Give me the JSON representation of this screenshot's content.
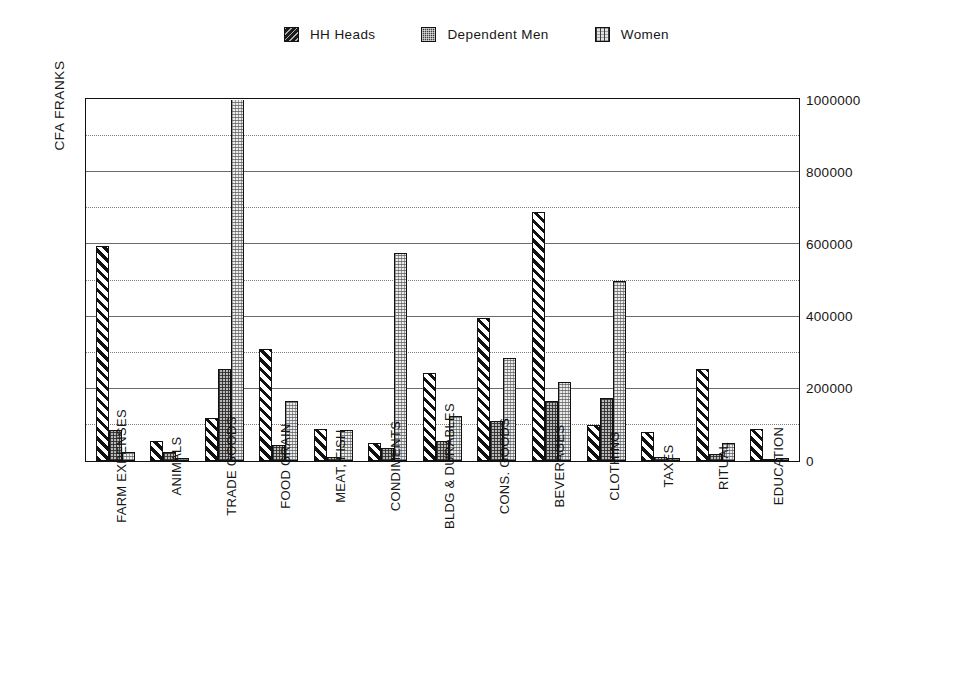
{
  "legend": {
    "position": "top-center",
    "entries": [
      {
        "label": "HH Heads",
        "swatch": "dense-dark-speckle-swatch",
        "color": "#1b1b1b"
      },
      {
        "label": "Dependent Men",
        "swatch": "mid-grey-crosshatch-swatch",
        "color": "#3d3d3d"
      },
      {
        "label": "Women",
        "swatch": "light-stipple-swatch",
        "color": "#e3e3e3"
      }
    ]
  },
  "axes": {
    "ylabel": "CFA FRANKS",
    "xlabel": "",
    "ytick_labels": [
      "1000000",
      "800000",
      "600000",
      "400000",
      "200000",
      "0"
    ]
  },
  "chart_data": {
    "type": "bar",
    "title": "",
    "subtitle": "",
    "xlabel": "",
    "ylabel": "CFA FRANKS",
    "ylim": [
      0,
      1000000
    ],
    "ytick_step": 200000,
    "gridline_step": 100000,
    "grid": true,
    "legend_position": "top-center",
    "categories": [
      "FARM EXPENSES",
      "ANIMALS",
      "TRADE GOODS",
      "FOOD GRAIN",
      "MEAT, FISH",
      "CONDIMENTS",
      "BLDG & DURABLES",
      "CONS. GOODS",
      "BEVERAGES",
      "CLOTHING",
      "TAXES",
      "RITUAL",
      "EDUCATION"
    ],
    "series": [
      {
        "name": "HH Heads",
        "values": [
          595000,
          55000,
          120000,
          310000,
          90000,
          50000,
          245000,
          395000,
          690000,
          100000,
          80000,
          255000,
          90000
        ]
      },
      {
        "name": "Dependent Men",
        "values": [
          85000,
          25000,
          255000,
          45000,
          10000,
          35000,
          55000,
          110000,
          165000,
          175000,
          10000,
          20000,
          5000
        ]
      },
      {
        "name": "Women",
        "values": [
          25000,
          8000,
          1000000,
          165000,
          85000,
          575000,
          125000,
          285000,
          220000,
          500000,
          8000,
          50000,
          8000
        ]
      }
    ],
    "notes": [
      "TRADE GOODS / Women bar is clipped at the top of the axis (exceeds 1000000)."
    ]
  }
}
